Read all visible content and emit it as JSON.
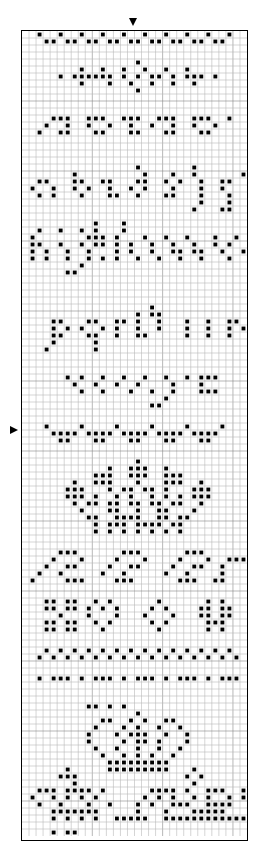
{
  "grid": {
    "cols": 32,
    "rows": 115,
    "cell_size": 7,
    "line_color": "#b8b8b8",
    "major_line_color": "#888888",
    "dot_color": "#000000",
    "background": "#ffffff"
  },
  "markers": {
    "top": {
      "symbol": "down-triangle",
      "col": 16
    },
    "left": {
      "symbol": "right-triangle",
      "row": 57
    }
  },
  "pattern": [
    "..#..#..#..#..#..#..#..#..#..#..",
    "...##.##.##.##.##.##.##.##.##...",
    "................................",
    "................................",
    "................#...............",
    "........#..#..#..#..#..#........",
    ".....#.######.#.#.##.#.###.#....",
    "........#...#..#..#..#..#.......",
    "................#...............",
    "................................",
    "................................",
    "................................",
    "....###..###..###..###..###..#..",
    "...#..#..#..#..#..#..#..#..#....",
    "..#..##...##...##...##...##.....",
    "................................",
    "................................",
    "................................",
    "................................",
    "................#.......#.......",
    ".......#.........#...#..#......#",
    "..##...##..##...##..#.#..#..##..",
    ".#..#..#.#..#..#.#...#...#..#...",
    "..#.#...#...##..#...##...#...#..",
    ".........................#...#..",
    "........................#...##..",
    "................................",
    "..........#...#.................",
    "..#..#..#.#...#.................",
    ".#.......###.#...#..#..#...#..#.",
    ".##..#..#.##.#.#..#..#..#..#.#.",
    ".#.#..#..#...#.#..#..##.##..#..#",
    ".#.#..#..#.#.#..#..#..#..#...#..",
    "........#.......................",
    "......##........................",
    "................................",
    "................................",
    "................................",
    "................................",
    "..................#.............",
    "................#.##............",
    "....##...##..##.#..#...#..#..##.",
    "....#.#.#..#.#..#..#...#..#..#.#",
    "....##...##..#..##.....#..#..#..",
    "....#.....#.....................",
    "...#......#.....................",
    "................................",
    "................................",
    "................................",
    "......#.#..#..#..#..#..#.###....",
    ".......#..#..#..#....#...#......",
    "........#..#...#..#..#...###....",
    "....................#...........",
    "..................##............",
    "................................",
    "................................",
    "...#....#....#....#....#....#...",
    "....####.####.####.####.####....",
    ".....##...##...##...##...##.....",
    "................................",
    "................................",
    "................#...............",
    "............#..###..#...........",
    "..........###..###..###.........",
    ".......#..###...#...###..#......",
    "......###...#.##.##.#...###.....",
    "......###.#..#.#..#.#.#.###.....",
    ".......#.##.##.##.##.##..#......",
    "........#...##..#..##...#.......",
    ".........##..####..##.##........",
    "..........#.###.####.##.........",
    "..........#.#.#.#.#.#.#.........",
    "................................",
    "................................",
    ".....###......###......###.....",
    "....#...#....#...#....#...#..###",
    "...#..##....#..##....#..##..#...",
    "..#..#.....#..#.....#..#....#...",
    ".#....###....###......###..##...",
    "................................",
    "................................",
    "...##.##..#.#......#......#.#...",
    "...##.##.#.#.#....#.#....##.##..",
    ".....#...#...#...#...#...##.##..",
    "...##.##..#.#.....#.#.....###...",
    "...##.##...#.......#......#.#...",
    "................................",
    "................................",
    "...#.#.#.#.#.#.#.#.#.#.#.#.#.#..",
    "..#.#.#.#.#.#.#.#.#.#.#.#.#.#.#.",
    "................................",
    "................................",
    "..#.###.#.###.#.###.#.###.#.###.",
    "................................",
    "................................",
    "................................",
    ".........##.#.#.................",
    "................#...............",
    "...........##..#.#..##..........",
    "..........#...#.#..#..#.........",
    ".........#...#.###..#..#........",
    ".........#....#.##.#...#........",
    "..........#..#..#..#..#.........",
    "...........#..#.#.#..#..........",
    "............#########...........",
    "......#.....#########...#.......",
    ".....###...............#.#......",
    ".......#................#.......",
    "..###.####.#......####.#..###..#",
    ".#..#.#.#.#......#.#.#..#.#..#.#",
    "..#..#...#..#...#.#..###..####..",
    "....#######.....#...#...#####...",
    "....#.#.#.#..#####..############",
    "................................",
    "....#.##........................",
    "................................"
  ]
}
